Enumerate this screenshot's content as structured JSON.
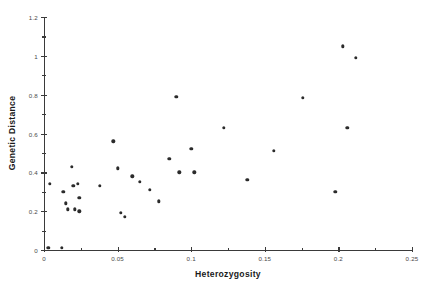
{
  "chart_data": {
    "type": "scatter",
    "title": "",
    "xlabel": "Heterozygosity",
    "ylabel": "Genetic Distance",
    "xlim": [
      0,
      0.25
    ],
    "ylim": [
      0,
      1.2
    ],
    "grid": false,
    "legend": null,
    "marker": {
      "shape": "circle",
      "color": "#2b2b2b",
      "size": 3.4
    },
    "xticks": [
      0,
      0.05,
      0.1,
      0.15,
      0.2,
      0.25
    ],
    "xtick_labels": [
      "0",
      "0.05",
      "0.1",
      "0.15",
      "0.2",
      "0.25"
    ],
    "xticks_minor": [
      0.025,
      0.075,
      0.125,
      0.175,
      0.225
    ],
    "yticks": [
      0,
      0.2,
      0.4,
      0.6,
      0.8,
      1,
      1.2
    ],
    "ytick_labels": [
      "0",
      "0.2",
      "0.4",
      "0.6",
      "0.8",
      "1",
      "1.2"
    ],
    "yticks_minor": [
      0.1,
      0.3,
      0.5,
      0.7,
      0.9,
      1.1
    ],
    "points": [
      {
        "x": 0.003,
        "y": 0.01
      },
      {
        "x": 0.012,
        "y": 0.01
      },
      {
        "x": 0.004,
        "y": 0.34
      },
      {
        "x": 0.013,
        "y": 0.3
      },
      {
        "x": 0.015,
        "y": 0.24
      },
      {
        "x": 0.016,
        "y": 0.21
      },
      {
        "x": 0.019,
        "y": 0.43
      },
      {
        "x": 0.02,
        "y": 0.33
      },
      {
        "x": 0.021,
        "y": 0.21
      },
      {
        "x": 0.023,
        "y": 0.34
      },
      {
        "x": 0.024,
        "y": 0.27
      },
      {
        "x": 0.024,
        "y": 0.2
      },
      {
        "x": 0.038,
        "y": 0.33
      },
      {
        "x": 0.047,
        "y": 0.56
      },
      {
        "x": 0.05,
        "y": 0.42
      },
      {
        "x": 0.052,
        "y": 0.19
      },
      {
        "x": 0.055,
        "y": 0.17
      },
      {
        "x": 0.06,
        "y": 0.38
      },
      {
        "x": 0.065,
        "y": 0.35
      },
      {
        "x": 0.072,
        "y": 0.31
      },
      {
        "x": 0.078,
        "y": 0.25
      },
      {
        "x": 0.085,
        "y": 0.47
      },
      {
        "x": 0.09,
        "y": 0.79
      },
      {
        "x": 0.092,
        "y": 0.4
      },
      {
        "x": 0.1,
        "y": 0.52
      },
      {
        "x": 0.102,
        "y": 0.4
      },
      {
        "x": 0.122,
        "y": 0.63
      },
      {
        "x": 0.138,
        "y": 0.36
      },
      {
        "x": 0.156,
        "y": 0.51
      },
      {
        "x": 0.176,
        "y": 0.785
      },
      {
        "x": 0.198,
        "y": 0.3
      },
      {
        "x": 0.203,
        "y": 1.05
      },
      {
        "x": 0.206,
        "y": 0.63
      },
      {
        "x": 0.212,
        "y": 0.99
      }
    ]
  }
}
